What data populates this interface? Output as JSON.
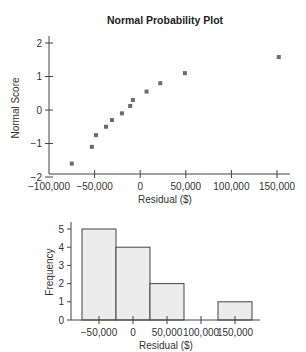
{
  "chart_data": [
    {
      "type": "scatter",
      "title": "Normal Probability Plot",
      "xlabel": "Residual ($)",
      "ylabel": "Normal Score",
      "xlim": [
        -100000,
        160000
      ],
      "ylim": [
        -2,
        2
      ],
      "x_ticks": [
        -100000,
        -50000,
        0,
        50000,
        100000,
        150000
      ],
      "x_tick_labels": [
        "−100,000",
        "−50,000",
        "0",
        "50,000",
        "100,000",
        "150,000"
      ],
      "y_ticks": [
        -2,
        -1,
        0,
        1,
        2
      ],
      "y_tick_labels": [
        "−2",
        "−1",
        "0",
        "1",
        "2"
      ],
      "grid": false,
      "points": [
        {
          "x": -75000,
          "y": -1.6
        },
        {
          "x": -53000,
          "y": -1.1
        },
        {
          "x": -48500,
          "y": -0.75
        },
        {
          "x": -37500,
          "y": -0.5
        },
        {
          "x": -31000,
          "y": -0.3
        },
        {
          "x": -20000,
          "y": -0.1
        },
        {
          "x": -11000,
          "y": 0.12
        },
        {
          "x": -8000,
          "y": 0.3
        },
        {
          "x": 7000,
          "y": 0.55
        },
        {
          "x": 22000,
          "y": 0.8
        },
        {
          "x": 49000,
          "y": 1.1
        },
        {
          "x": 152000,
          "y": 1.58
        }
      ]
    },
    {
      "type": "bar",
      "title": "",
      "xlabel": "Residual ($)",
      "ylabel": "Frequency",
      "categories": [
        "-50,000",
        "0",
        "50,000",
        "100,000",
        "150,000"
      ],
      "bin_edges": [
        -75000,
        -25000,
        25000,
        75000,
        125000,
        175000
      ],
      "values": [
        5,
        4,
        2,
        0,
        1
      ],
      "x_tick_labels": [
        "−50,000",
        "0",
        "50,000",
        "100,000",
        "150,000"
      ],
      "y_ticks": [
        0,
        1,
        2,
        3,
        4,
        5
      ],
      "y_tick_labels": [
        "0",
        "1",
        "2",
        "3",
        "4",
        "5"
      ],
      "ylim": [
        0,
        5.3
      ],
      "grid": false,
      "bar_color": "#ececec"
    }
  ]
}
